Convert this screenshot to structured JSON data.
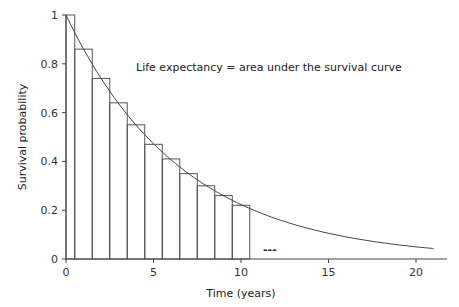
{
  "chart_data": {
    "type": "bar",
    "title": "",
    "annotation": "Life expectancy = area under the survival curve",
    "xlabel": "Time (years)",
    "ylabel": "Survival probability",
    "xlim": [
      0,
      22
    ],
    "ylim": [
      0,
      1
    ],
    "xticks": [
      0,
      5,
      10,
      15,
      20
    ],
    "yticks": [
      0,
      0.2,
      0.4,
      0.6,
      0.8,
      1
    ],
    "ytick_labels": [
      "0",
      "0.2",
      "0.4",
      "0.6",
      "0.8",
      "1"
    ],
    "grid": false,
    "legend": "none",
    "bars": {
      "description": "Rectangles approximating area under curve; centered on integer years, first bar half-width",
      "x_left": [
        0,
        0.5,
        1.5,
        2.5,
        3.5,
        4.5,
        5.5,
        6.5,
        7.5,
        8.5,
        9.5
      ],
      "x_right": [
        0.5,
        1.5,
        2.5,
        3.5,
        4.5,
        5.5,
        6.5,
        7.5,
        8.5,
        9.5,
        10.5
      ],
      "values": [
        1.0,
        0.86,
        0.74,
        0.64,
        0.55,
        0.47,
        0.41,
        0.35,
        0.3,
        0.26,
        0.22
      ]
    },
    "series": [
      {
        "name": "Survival curve",
        "type": "line",
        "function": "exp(-0.15 t)",
        "x": [
          0,
          1,
          2,
          3,
          4,
          5,
          6,
          7,
          8,
          9,
          10,
          11,
          12,
          13,
          14,
          15,
          16,
          17,
          18,
          19,
          20,
          21
        ],
        "values": [
          1.0,
          0.86,
          0.74,
          0.64,
          0.55,
          0.47,
          0.41,
          0.35,
          0.3,
          0.26,
          0.22,
          0.19,
          0.17,
          0.14,
          0.12,
          0.11,
          0.09,
          0.08,
          0.07,
          0.06,
          0.05,
          0.04
        ]
      }
    ],
    "ellipsis_marker": "---"
  }
}
